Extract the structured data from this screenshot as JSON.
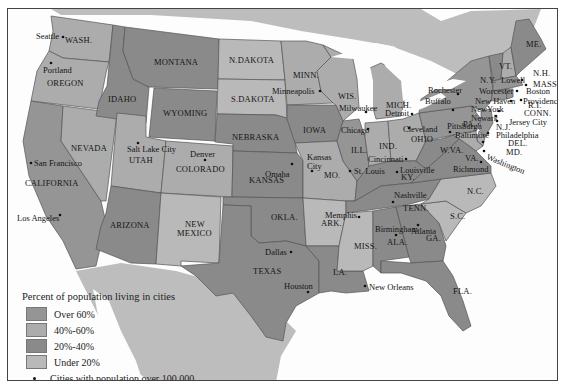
{
  "colors": {
    "over_60": "#959595",
    "40_60": "#acacac",
    "20_40": "#8a8a8a",
    "under_20": "#b9b9b9",
    "water": "#fdfdfd",
    "outside": "#bdbdbd"
  },
  "legend": {
    "title": "Percent of population living in cities",
    "items": [
      {
        "label": "Over 60%",
        "class": "over_60"
      },
      {
        "label": "40%-60%",
        "class": "40_60"
      },
      {
        "label": "20%-40%",
        "class": "20_40"
      },
      {
        "label": "Under 20%",
        "class": "under_20"
      }
    ],
    "dot_label": "Cities with population over 100,000"
  },
  "states": [
    {
      "name": "WASH.",
      "class": "40_60"
    },
    {
      "name": "OREGON",
      "class": "40_60"
    },
    {
      "name": "CALIFORNIA",
      "class": "over_60"
    },
    {
      "name": "NEVADA",
      "class": "40_60"
    },
    {
      "name": "IDAHO",
      "class": "20_40"
    },
    {
      "name": "MONTANA",
      "class": "20_40"
    },
    {
      "name": "WYOMING",
      "class": "20_40"
    },
    {
      "name": "UTAH",
      "class": "40_60"
    },
    {
      "name": "COLORADO",
      "class": "40_60"
    },
    {
      "name": "ARIZONA",
      "class": "20_40"
    },
    {
      "name": "NEW MEXICO",
      "class": "under_20"
    },
    {
      "name": "N.DAKOTA",
      "class": "under_20"
    },
    {
      "name": "S.DAKOTA",
      "class": "under_20"
    },
    {
      "name": "NEBRASKA",
      "class": "20_40"
    },
    {
      "name": "KANSAS",
      "class": "20_40"
    },
    {
      "name": "OKLA.",
      "class": "20_40"
    },
    {
      "name": "TEXAS",
      "class": "20_40"
    },
    {
      "name": "MINN.",
      "class": "40_60"
    },
    {
      "name": "IOWA",
      "class": "20_40"
    },
    {
      "name": "MO.",
      "class": "40_60"
    },
    {
      "name": "ARK.",
      "class": "under_20"
    },
    {
      "name": "LA.",
      "class": "20_40"
    },
    {
      "name": "WIS.",
      "class": "40_60"
    },
    {
      "name": "ILL.",
      "class": "over_60"
    },
    {
      "name": "MICH.",
      "class": "40_60"
    },
    {
      "name": "IND.",
      "class": "40_60"
    },
    {
      "name": "OHIO",
      "class": "40_60"
    },
    {
      "name": "KY.",
      "class": "20_40"
    },
    {
      "name": "TENN.",
      "class": "20_40"
    },
    {
      "name": "MISS.",
      "class": "under_20"
    },
    {
      "name": "ALA.",
      "class": "20_40"
    },
    {
      "name": "GA.",
      "class": "20_40"
    },
    {
      "name": "FLA.",
      "class": "20_40"
    },
    {
      "name": "S.C.",
      "class": "under_20"
    },
    {
      "name": "N.C.",
      "class": "under_20"
    },
    {
      "name": "VA.",
      "class": "20_40"
    },
    {
      "name": "W.VA.",
      "class": "20_40"
    },
    {
      "name": "PA.",
      "class": "over_60"
    },
    {
      "name": "N.Y.",
      "class": "over_60"
    },
    {
      "name": "VT.",
      "class": "20_40"
    },
    {
      "name": "N.H.",
      "class": "40_60"
    },
    {
      "name": "ME.",
      "class": "20_40"
    },
    {
      "name": "MASS.",
      "class": "over_60"
    },
    {
      "name": "R.I.",
      "class": "over_60"
    },
    {
      "name": "CONN.",
      "class": "over_60"
    },
    {
      "name": "N.J.",
      "class": "over_60"
    },
    {
      "name": "DEL.",
      "class": "40_60"
    },
    {
      "name": "MD.",
      "class": "40_60"
    }
  ],
  "cities": [
    "Seattle",
    "Portland",
    "San Francisco",
    "Los Angeles",
    "Salt Lake City",
    "Denver",
    "Minneapolis",
    "Omaha",
    "Kansas City",
    "Dallas",
    "Houston",
    "Memphis",
    "New Orleans",
    "Milwaukee",
    "Chicago",
    "St. Louis",
    "Detroit",
    "Cleveland",
    "Cincinnati",
    "Louisville",
    "Nashville",
    "Birmingham",
    "Atlanta",
    "Pittsburgh",
    "Baltimore",
    "Washington",
    "Richmond",
    "Rochester",
    "Buffalo",
    "Lowell",
    "Worcester",
    "Boston",
    "New Haven",
    "Providence",
    "New York",
    "Newark",
    "Jersey City",
    "Philadelphia"
  ],
  "labels": {
    "wash": "WASH.",
    "oregon": "OREGON",
    "california": "CALIFORNIA",
    "nevada": "NEVADA",
    "idaho": "IDAHO",
    "montana": "MONTANA",
    "wyoming": "WYOMING",
    "utah": "UTAH",
    "colorado": "COLORADO",
    "arizona": "ARIZONA",
    "newmexico1": "NEW",
    "newmexico2": "MEXICO",
    "ndakota": "N.DAKOTA",
    "sdakota": "S.DAKOTA",
    "nebraska": "NEBRASKA",
    "kansas": "KANSAS",
    "okla": "OKLA.",
    "texas": "TEXAS",
    "minn": "MINN.",
    "iowa": "IOWA",
    "mo": "MO.",
    "ark": "ARK.",
    "la": "LA.",
    "wis": "WIS.",
    "ill": "ILL.",
    "mich": "MICH.",
    "ind": "IND.",
    "ohio": "OHIO",
    "ky": "KY.",
    "tenn": "TENN.",
    "miss": "MISS.",
    "ala": "ALA.",
    "ga": "GA.",
    "fla": "FLA.",
    "sc": "S.C.",
    "nc": "N.C.",
    "va": "VA.",
    "wva": "W.VA.",
    "pa": "PA.",
    "ny": "N.Y.",
    "vt": "VT.",
    "nh": "N.H.",
    "me": "ME.",
    "mass": "MASS.",
    "ri": "R.I.",
    "conn": "CONN.",
    "nj": "N.J.",
    "del": "DEL.",
    "md": "MD.",
    "seattle": "Seattle",
    "portland": "Portland",
    "sanfrancisco": "San Francisco",
    "losangeles": "Los Angeles",
    "saltlake": "Salt Lake City",
    "denver": "Denver",
    "minneapolis": "Minneapolis",
    "omaha": "Omaha",
    "kansascity1": "Kansas",
    "kansascity2": "City",
    "dallas": "Dallas",
    "houston": "Houston",
    "memphis": "Memphis",
    "neworleans": "New Orleans",
    "milwaukee": "Milwaukee",
    "chicago": "Chicago",
    "stlouis": "St. Louis",
    "detroit": "Detroit",
    "cleveland": "Cleveland",
    "cincinnati": "Cincinnati",
    "louisville": "Louisville",
    "nashville": "Nashville",
    "birmingham": "Birmingham",
    "atlanta": "Atlanta",
    "pittsburgh": "Pittsburgh",
    "baltimore": "Baltimore",
    "washington": "Washington",
    "richmond": "Richmond",
    "rochester": "Rochester",
    "buffalo": "Buffalo",
    "lowell": "Lowell",
    "worcester": "Worcester",
    "boston": "Boston",
    "newhaven": "New Haven",
    "providence": "Providence",
    "newyork": "NewYork",
    "newark": "Newark",
    "jerseycity": "Jersey City",
    "philadelphia": "Philadelphia"
  }
}
